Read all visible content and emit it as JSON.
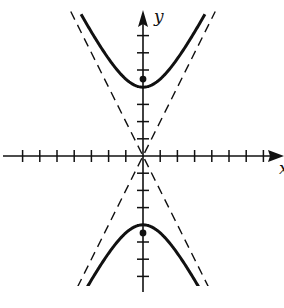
{
  "chart_data": {
    "type": "line",
    "title": "",
    "xlabel": "x",
    "ylabel": "y",
    "xlim": [
      -8,
      8
    ],
    "ylim": [
      -8,
      8
    ],
    "grid": false,
    "tick_spacing": 1,
    "series": [
      {
        "name": "upper branch",
        "style": "solid",
        "equation": "y = 4*sqrt(1 + x^2/4)",
        "vertex": [
          0,
          4
        ]
      },
      {
        "name": "lower branch",
        "style": "solid",
        "equation": "y = -4*sqrt(1 + x^2/4)",
        "vertex": [
          0,
          -4
        ]
      },
      {
        "name": "asymptote 1",
        "style": "dashed",
        "equation": "y = 2x"
      },
      {
        "name": "asymptote 2",
        "style": "dashed",
        "equation": "y = -2x"
      }
    ],
    "points": [
      {
        "name": "focus upper",
        "x": 0,
        "y": 4.47
      },
      {
        "name": "focus lower",
        "x": 0,
        "y": -4.47
      }
    ],
    "params": {
      "a": 4,
      "b": 2,
      "c": 4.47
    }
  },
  "labels": {
    "x_axis": "x",
    "y_axis": "y"
  },
  "colors": {
    "ink": "#111111",
    "background": "#ffffff"
  }
}
